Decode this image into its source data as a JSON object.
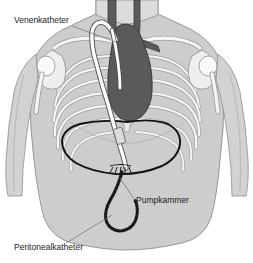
{
  "figure": {
    "language": "de",
    "background_color": "#ffffff"
  },
  "labels": [
    {
      "key": "venenkatheter",
      "text": "Venenkatheter",
      "x": 14,
      "y": 23,
      "leader_from": [
        72,
        26
      ],
      "leader_to": [
        116,
        42
      ]
    },
    {
      "key": "pumpkammer",
      "text": "Pumpkammer",
      "x": 136,
      "y": 203,
      "leader_from": [
        134,
        199
      ],
      "leader_to": [
        120,
        178
      ]
    },
    {
      "key": "peritonealkatheter",
      "text": "Peritonealkatheter",
      "x": 14,
      "y": 250,
      "leader_from": [
        66,
        243
      ],
      "leader_to": [
        112,
        215
      ]
    }
  ],
  "anatomy": {
    "body_fill": "#cdcdcd",
    "body_stroke": "#8a8a8a",
    "bone_fill": "#f4f4f4",
    "bone_stroke": "#9a9a9a",
    "heart_fill": "#5a5a5a",
    "heart_stroke": "#3d3d3d",
    "shadow_fill": "#b4b4b4",
    "parts": [
      "torso",
      "neck",
      "left-arm",
      "right-arm",
      "clavicles",
      "scapulae",
      "humerus-heads",
      "ribcage",
      "sternum",
      "heart",
      "great-vessels",
      "diaphragm"
    ]
  },
  "device": {
    "venous_catheter": {
      "name": "Venenkatheter",
      "color": "#ffffff",
      "stroke": "#5b5b5b",
      "description": "weisser Schlauch mit Schleife unterhalb des Schluesselbeins"
    },
    "pump_chamber": {
      "name": "Pumpkammer",
      "color": "#111111",
      "description": "grosser dunkler Umriss im Oberbauch"
    },
    "peritoneal_catheter": {
      "name": "Peritonealkatheter",
      "color": "#1a1a1a",
      "description": "gepunkteter hakenfoermiger Katheter im Unterbauch"
    },
    "connector": {
      "name": "Konnektor",
      "color": "#d8d8d8"
    }
  }
}
